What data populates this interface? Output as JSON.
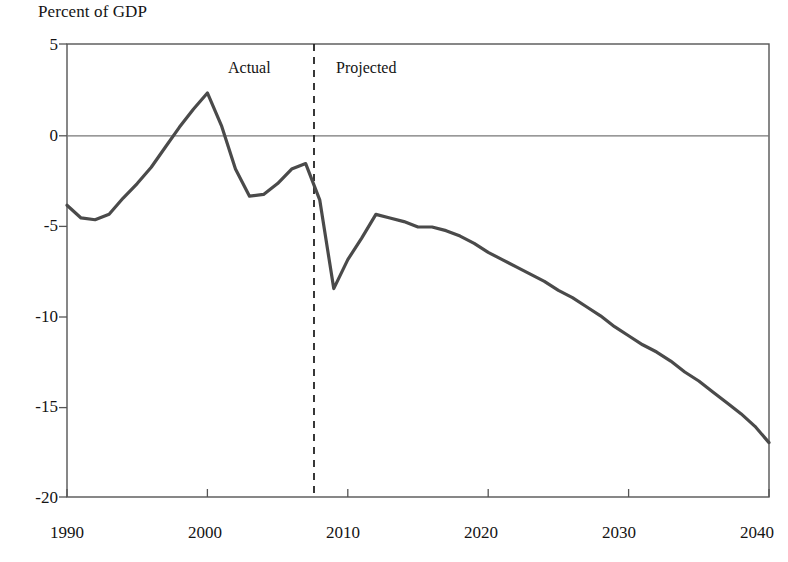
{
  "chart_data": {
    "type": "line",
    "title": "Percent of GDP",
    "xlabel": "",
    "ylabel": "",
    "grid": false,
    "legend": false,
    "xlim": [
      1990,
      2040
    ],
    "ylim": [
      -20,
      5
    ],
    "y_ticks": [
      5,
      0,
      -5,
      -10,
      -15,
      -20
    ],
    "y_tick_labels": [
      "5",
      "0",
      "-5",
      "-10",
      "-15",
      "-20"
    ],
    "x_ticks": [
      1990,
      2000,
      2010,
      2020,
      2030,
      2040
    ],
    "x_tick_labels": [
      "1990",
      "2000",
      "2010",
      "2020",
      "2030",
      "2040"
    ],
    "zero_line": 0,
    "annotations": [
      {
        "text": "Actual",
        "x": 2003.5,
        "y": 3.6
      },
      {
        "text": "Projected",
        "x": 2012.5,
        "y": 3.6
      }
    ],
    "divider": {
      "type": "vertical-dashed",
      "x": 2008,
      "label_left": "Actual",
      "label_right": "Projected"
    },
    "series": [
      {
        "name": "Budget deficit or surplus",
        "color": "#4a4a4a",
        "x": [
          1990,
          1991,
          1992,
          1993,
          1994,
          1995,
          1996,
          1997,
          1998,
          1999,
          2000,
          2001,
          2002,
          2003,
          2004,
          2005,
          2006,
          2007,
          2008,
          2009,
          2010,
          2011,
          2012,
          2013,
          2014,
          2015,
          2016,
          2017,
          2018,
          2019,
          2020,
          2021,
          2022,
          2023,
          2024,
          2025,
          2026,
          2027,
          2028,
          2029,
          2030,
          2031,
          2032,
          2033,
          2034,
          2035,
          2036,
          2037,
          2038,
          2039,
          2040
        ],
        "values": [
          -3.9,
          -4.6,
          -4.7,
          -4.4,
          -3.5,
          -2.7,
          -1.8,
          -0.7,
          0.4,
          1.4,
          2.3,
          0.5,
          -1.9,
          -3.4,
          -3.3,
          -2.7,
          -1.9,
          -1.6,
          -3.6,
          -8.5,
          -6.9,
          -5.7,
          -4.4,
          -4.6,
          -4.8,
          -5.1,
          -5.1,
          -5.3,
          -5.6,
          -6.0,
          -6.5,
          -6.9,
          -7.3,
          -7.7,
          -8.1,
          -8.6,
          -9.0,
          -9.5,
          -10.0,
          -10.6,
          -11.1,
          -11.6,
          -12.0,
          -12.5,
          -13.1,
          -13.6,
          -14.2,
          -14.8,
          -15.4,
          -16.1,
          -17.0
        ]
      }
    ]
  },
  "axis": {
    "y_labels": [
      "5",
      "0",
      "-5",
      "-10",
      "-15",
      "-20"
    ],
    "x_labels": [
      "1990",
      "2000",
      "2010",
      "2020",
      "2030",
      "2040"
    ]
  },
  "labels": {
    "title": "Percent of GDP",
    "actual": "Actual",
    "projected": "Projected"
  }
}
